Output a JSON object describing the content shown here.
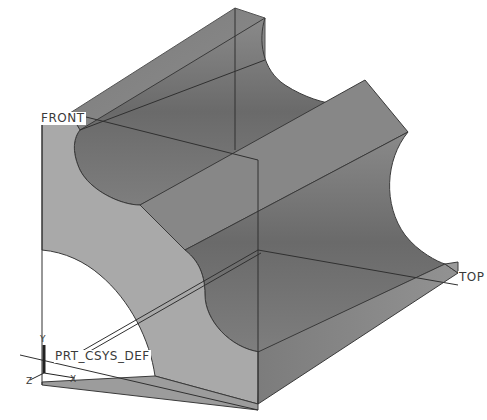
{
  "viewport": {
    "background": "#ffffff",
    "model": "grooved block with four semicircular channels (shaded, isometric view)"
  },
  "datum_planes": [
    {
      "name": "FRONT",
      "label": "FRONT"
    },
    {
      "name": "TOP",
      "label": "TOP"
    }
  ],
  "coordinate_system": {
    "name": "PRT_CSYS_DEF",
    "label": "PRT_CSYS_DEF",
    "axes": {
      "x": "X",
      "y": "Y",
      "z": "Z"
    }
  },
  "colors": {
    "face_light": "#a8a8a8",
    "face_mid": "#8a8a8a",
    "face_dark": "#6e6e6e",
    "groove_shade": "#757575",
    "edge": "#2a2a2a",
    "datum_line": "#303030"
  }
}
